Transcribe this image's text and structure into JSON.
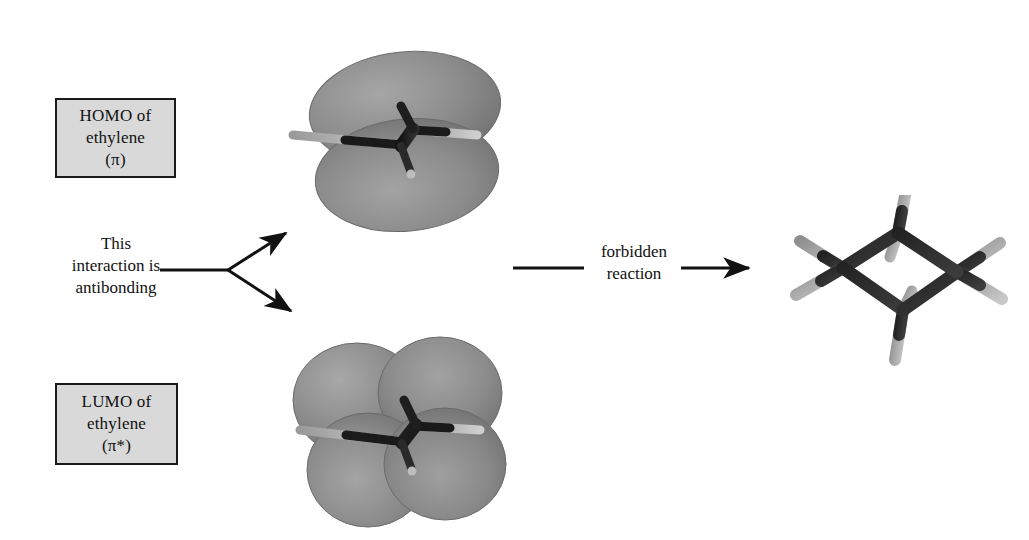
{
  "diagram": {
    "background_color": "#ffffff"
  },
  "labels": {
    "homo_box": {
      "line1": "HOMO of",
      "line2": "ethylene",
      "line3": "(π)",
      "fill_color": "#d9d9d9",
      "border_color": "#1a1a1a"
    },
    "lumo_box": {
      "line1": "LUMO of",
      "line2": "ethylene",
      "line3": "(π*)",
      "fill_color": "#d9d9d9",
      "border_color": "#1a1a1a"
    },
    "antibonding": {
      "line1": "This",
      "line2": "interaction is",
      "line3": "antibonding"
    },
    "reaction": {
      "line1": "forbidden",
      "line2": "reaction"
    }
  },
  "arrows": {
    "fork_stem": {
      "x1": 160,
      "y1": 270,
      "x2": 228,
      "y2": 270
    },
    "fork_upper": {
      "x1": 228,
      "y1": 270,
      "x2": 286,
      "y2": 233
    },
    "fork_lower": {
      "x1": 228,
      "y1": 270,
      "x2": 291,
      "y2": 311
    },
    "reaction_line": {
      "x1": 513,
      "y1": 268,
      "x2": 584,
      "y2": 268
    },
    "reaction_arrow": {
      "x1": 681,
      "y1": 268,
      "x2": 749,
      "y2": 268
    },
    "stroke_color": "#111111"
  },
  "orbitals": {
    "homo": {
      "name": "pi-bonding-orbital",
      "lobe_count": 2,
      "lobe_color": "#8e8e8e",
      "lobe_edge_color": "#6f6f6f",
      "description": "Two large lobes above and below the ethylene plane, same phase"
    },
    "lumo": {
      "name": "pi-star-antibonding-orbital",
      "lobe_count": 4,
      "lobe_color": "#8e8e8e",
      "lobe_edge_color": "#6f6f6f",
      "description": "Four lobes, two above and two below, nodal plane between carbons"
    },
    "molecule_colors": {
      "carbon": "#1e1e1e",
      "hydrogen": "#b8b8b8"
    }
  },
  "product": {
    "name": "cyclobutane",
    "ring_atoms": 4,
    "carbon_color": "#2b2b2b",
    "hydrogen_color": "#b5b5b5"
  }
}
